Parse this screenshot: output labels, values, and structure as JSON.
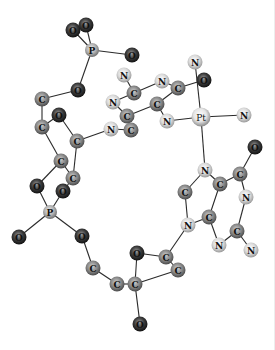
{
  "figure": {
    "title": ""
  },
  "element_styles": {
    "C": {
      "fill": "#8a8a8a",
      "highlight": "#d0d0d0",
      "rim": "#4a4a4a"
    },
    "N": {
      "fill": "#dcdcdc",
      "highlight": "#ffffff",
      "rim": "#9a9a9a"
    },
    "O": {
      "fill": "#3a3a3a",
      "highlight": "#9a9a9a",
      "rim": "#111111"
    },
    "P": {
      "fill": "#b4b4b4",
      "highlight": "#eeeeee",
      "rim": "#6e6e6e"
    },
    "Pt": {
      "fill": "#e6e6e6",
      "highlight": "#ffffff",
      "rim": "#8a8a8a"
    }
  },
  "atoms": [
    {
      "id": "o1",
      "el": "O"
    },
    {
      "id": "o2",
      "el": "O"
    },
    {
      "id": "p1",
      "el": "P"
    },
    {
      "id": "o3",
      "el": "O"
    },
    {
      "id": "o4",
      "el": "O"
    },
    {
      "id": "c1",
      "el": "C"
    },
    {
      "id": "o5",
      "el": "O"
    },
    {
      "id": "c2",
      "el": "C"
    },
    {
      "id": "c3",
      "el": "C"
    },
    {
      "id": "c4",
      "el": "C"
    },
    {
      "id": "c5",
      "el": "C"
    },
    {
      "id": "o6",
      "el": "O"
    },
    {
      "id": "o7",
      "el": "O"
    },
    {
      "id": "p2",
      "el": "P"
    },
    {
      "id": "o8",
      "el": "O"
    },
    {
      "id": "o9",
      "el": "O"
    },
    {
      "id": "c6",
      "el": "C"
    },
    {
      "id": "c7",
      "el": "C"
    },
    {
      "id": "c8",
      "el": "C"
    },
    {
      "id": "o10",
      "el": "O"
    },
    {
      "id": "c9",
      "el": "C"
    },
    {
      "id": "c10",
      "el": "C"
    },
    {
      "id": "o11",
      "el": "O"
    },
    {
      "id": "n1",
      "el": "N"
    },
    {
      "id": "c11",
      "el": "C"
    },
    {
      "id": "n2",
      "el": "N"
    },
    {
      "id": "c12",
      "el": "C"
    },
    {
      "id": "c13",
      "el": "C"
    },
    {
      "id": "n3",
      "el": "N"
    },
    {
      "id": "n4",
      "el": "N"
    },
    {
      "id": "c14",
      "el": "C"
    },
    {
      "id": "n5",
      "el": "N"
    },
    {
      "id": "c15",
      "el": "C"
    },
    {
      "id": "o12",
      "el": "O"
    },
    {
      "id": "n6",
      "el": "N"
    },
    {
      "id": "pt",
      "el": "Pt"
    },
    {
      "id": "n7",
      "el": "N"
    },
    {
      "id": "n8",
      "el": "N"
    },
    {
      "id": "c16",
      "el": "C"
    },
    {
      "id": "c17",
      "el": "C"
    },
    {
      "id": "o13",
      "el": "O"
    },
    {
      "id": "n9",
      "el": "N"
    },
    {
      "id": "c18",
      "el": "C"
    },
    {
      "id": "n10",
      "el": "N"
    },
    {
      "id": "c19",
      "el": "C"
    },
    {
      "id": "c20",
      "el": "C"
    },
    {
      "id": "n11",
      "el": "N"
    },
    {
      "id": "n12",
      "el": "N"
    }
  ],
  "bonds": [
    [
      "o1",
      "p1"
    ],
    [
      "o2",
      "p1"
    ],
    [
      "p1",
      "o3"
    ],
    [
      "p1",
      "o4"
    ],
    [
      "o4",
      "c1"
    ],
    [
      "c1",
      "c2"
    ],
    [
      "c2",
      "c3"
    ],
    [
      "o5",
      "c4"
    ],
    [
      "c2",
      "o5"
    ],
    [
      "c4",
      "n3"
    ],
    [
      "c4",
      "c5"
    ],
    [
      "c3",
      "c5"
    ],
    [
      "c3",
      "o6"
    ],
    [
      "c5",
      "o7"
    ],
    [
      "o6",
      "p2"
    ],
    [
      "o7",
      "p2"
    ],
    [
      "p2",
      "o8"
    ],
    [
      "p2",
      "o9"
    ],
    [
      "o9",
      "c6"
    ],
    [
      "c6",
      "c7"
    ],
    [
      "c7",
      "c8"
    ],
    [
      "c8",
      "o10"
    ],
    [
      "o10",
      "c9"
    ],
    [
      "c9",
      "c10"
    ],
    [
      "c8",
      "c10"
    ],
    [
      "c8",
      "o11"
    ],
    [
      "c9",
      "n10"
    ],
    [
      "n1",
      "c11"
    ],
    [
      "c11",
      "n2"
    ],
    [
      "n2",
      "c12"
    ],
    [
      "c12",
      "c13"
    ],
    [
      "c13",
      "n3"
    ],
    [
      "c12",
      "c14"
    ],
    [
      "c11",
      "n4"
    ],
    [
      "n4",
      "c15"
    ],
    [
      "c15",
      "c14"
    ],
    [
      "c14",
      "n5"
    ],
    [
      "n5",
      "pt"
    ],
    [
      "c15",
      "o12"
    ],
    [
      "pt",
      "n6"
    ],
    [
      "pt",
      "n7"
    ],
    [
      "pt",
      "n8"
    ],
    [
      "n8",
      "c16"
    ],
    [
      "c16",
      "c17"
    ],
    [
      "c17",
      "o13"
    ],
    [
      "c17",
      "n9"
    ],
    [
      "c16",
      "c19"
    ],
    [
      "c18",
      "n8"
    ],
    [
      "c18",
      "n10"
    ],
    [
      "n10",
      "c19"
    ],
    [
      "c19",
      "n11"
    ],
    [
      "n11",
      "c20"
    ],
    [
      "c20",
      "n9"
    ],
    [
      "c20",
      "n12"
    ]
  ]
}
